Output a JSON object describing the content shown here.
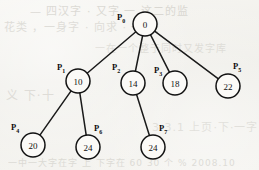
{
  "figure": {
    "caption": "",
    "background_color": "#f3f2ee",
    "ink_color": "#121212"
  },
  "chart_data": {
    "type": "diagram",
    "title": "",
    "subtitle": "",
    "xlabel": "",
    "ylabel": "",
    "grid": false,
    "legend_position": "none",
    "diagram_kind": "tree",
    "nodes": [
      {
        "id": "P0",
        "tag": "P",
        "tag_sub": "0",
        "value": "0",
        "cx": 145,
        "cy": 24,
        "r": 12,
        "tag_x": 117,
        "tag_y": 20,
        "tag_anchor": "left"
      },
      {
        "id": "P1",
        "tag": "P",
        "tag_sub": "1",
        "value": "10",
        "cx": 78,
        "cy": 81,
        "r": 12,
        "tag_x": 57,
        "tag_y": 70,
        "tag_anchor": "left"
      },
      {
        "id": "P2",
        "tag": "P",
        "tag_sub": "2",
        "value": "14",
        "cx": 133,
        "cy": 83,
        "r": 12,
        "tag_x": 112,
        "tag_y": 70,
        "tag_anchor": "left"
      },
      {
        "id": "P3",
        "tag": "P",
        "tag_sub": "3",
        "value": "18",
        "cx": 175,
        "cy": 83,
        "r": 12,
        "tag_x": 154,
        "tag_y": 73,
        "tag_anchor": "left"
      },
      {
        "id": "P5",
        "tag": "P",
        "tag_sub": "5",
        "value": "22",
        "cx": 228,
        "cy": 86,
        "r": 12,
        "tag_x": 233,
        "tag_y": 69,
        "tag_anchor": "left"
      },
      {
        "id": "P4",
        "tag": "P",
        "tag_sub": "4",
        "value": "20",
        "cx": 33,
        "cy": 145,
        "r": 12,
        "tag_x": 11,
        "tag_y": 130,
        "tag_anchor": "left"
      },
      {
        "id": "P6",
        "tag": "P",
        "tag_sub": "6",
        "value": "24",
        "cx": 88,
        "cy": 147,
        "r": 12,
        "tag_x": 94,
        "tag_y": 131,
        "tag_anchor": "left"
      },
      {
        "id": "P7",
        "tag": "P",
        "tag_sub": "7",
        "value": "24",
        "cx": 153,
        "cy": 147,
        "r": 12,
        "tag_x": 159,
        "tag_y": 131,
        "tag_anchor": "left"
      }
    ],
    "edges": [
      {
        "from": "P0",
        "to": "P1"
      },
      {
        "from": "P0",
        "to": "P2"
      },
      {
        "from": "P0",
        "to": "P3"
      },
      {
        "from": "P0",
        "to": "P5"
      },
      {
        "from": "P1",
        "to": "P4"
      },
      {
        "from": "P1",
        "to": "P6"
      },
      {
        "from": "P2",
        "to": "P7"
      }
    ],
    "values": [
      0,
      10,
      14,
      18,
      22,
      20,
      24,
      24
    ],
    "categories": [
      "P0",
      "P1",
      "P2",
      "P3",
      "P5",
      "P4",
      "P6",
      "P7"
    ]
  },
  "background_marks": [
    {
      "text": "— 四汉字 · 又字 一 这二的监",
      "x": 30,
      "y": 2,
      "size": 11,
      "opacity": 0.45
    },
    {
      "text": "花类 ，一身字 · 向求 · 一 空",
      "x": 4,
      "y": 18,
      "size": 11,
      "opacity": 0.4
    },
    {
      "text": "一在一个整于同时又发字库",
      "x": 95,
      "y": 40,
      "size": 10,
      "opacity": 0.35
    },
    {
      "text": "义  下·十",
      "x": 6,
      "y": 86,
      "size": 12,
      "opacity": 0.38
    },
    {
      "text": "3.3.1  上页·下·一字",
      "x": 152,
      "y": 118,
      "size": 11,
      "opacity": 0.33
    },
    {
      "text": "一中一大字在字  上  下字在 60 30 个 % 2008.10",
      "x": 8,
      "y": 156,
      "size": 9,
      "opacity": 0.4
    }
  ]
}
